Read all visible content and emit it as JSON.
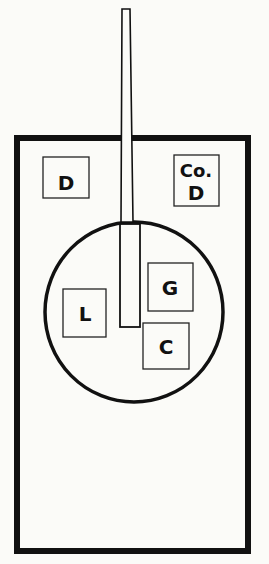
{
  "diagram": {
    "type": "layout-plan",
    "outer_frame": {
      "label": ""
    },
    "boxes": [
      {
        "id": "d",
        "label": "D"
      },
      {
        "id": "co-d",
        "label_line1": "Co.",
        "label_line2": "D"
      },
      {
        "id": "g",
        "label": "G"
      },
      {
        "id": "l",
        "label": "L"
      },
      {
        "id": "c",
        "label": "C"
      }
    ]
  },
  "colors": {
    "ink": "#111111",
    "paper": "#fbfbf8"
  }
}
